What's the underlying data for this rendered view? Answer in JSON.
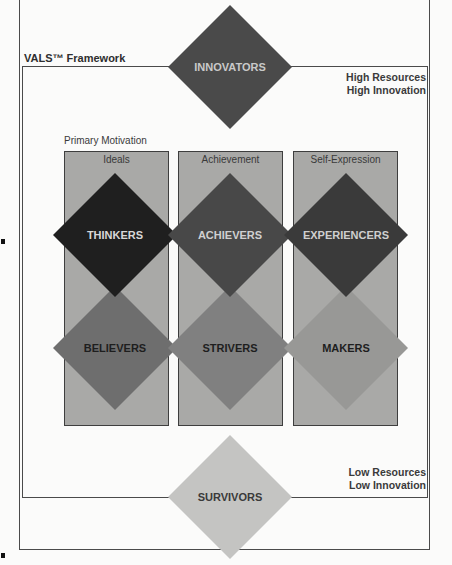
{
  "diagram": {
    "title": "VALS™ Framework",
    "top_right_label": {
      "line1": "High Resources",
      "line2": "High Innovation"
    },
    "bottom_right_label": {
      "line1": "Low Resources",
      "line2": "Low Innovation"
    },
    "motivation_axis_label": "Primary Motivation",
    "columns": [
      {
        "header": "Ideals"
      },
      {
        "header": "Achievement"
      },
      {
        "header": "Self-Expression"
      }
    ],
    "segments": [
      {
        "name": "INNOVATORS",
        "cx": 230,
        "cy": 67,
        "fill": "#4a4a4a",
        "text_color": "#c9c9c9"
      },
      {
        "name": "THINKERS",
        "cx": 115,
        "cy": 235,
        "fill": "#1f1f1f",
        "text_color": "#d8d8d8"
      },
      {
        "name": "ACHIEVERS",
        "cx": 230,
        "cy": 235,
        "fill": "#484848",
        "text_color": "#d0d0d0"
      },
      {
        "name": "EXPERIENCERS",
        "cx": 346,
        "cy": 235,
        "fill": "#3a3a3a",
        "text_color": "#cfcfcf"
      },
      {
        "name": "BELIEVERS",
        "cx": 115,
        "cy": 348,
        "fill": "#6e6e6e",
        "text_color": "#1e1e1e"
      },
      {
        "name": "STRIVERS",
        "cx": 230,
        "cy": 348,
        "fill": "#808080",
        "text_color": "#1e1e1e"
      },
      {
        "name": "MAKERS",
        "cx": 346,
        "cy": 348,
        "fill": "#989896",
        "text_color": "#1e1e1e"
      },
      {
        "name": "SURVIVORS",
        "cx": 230,
        "cy": 497,
        "fill": "#c4c4c2",
        "text_color": "#3a3a3a"
      }
    ],
    "colors": {
      "column_fill": "#a9a9a7",
      "frame_line": "#4a4a4a",
      "background": "#fbfbfa"
    }
  }
}
